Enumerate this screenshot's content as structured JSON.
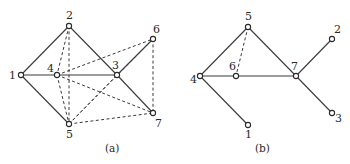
{
  "figures": [
    {
      "id": "a",
      "caption": "(a)",
      "caption_pos": [
        105,
        152
      ],
      "nodes": [
        {
          "id": "1",
          "x": 21,
          "y": 75,
          "lx": 9,
          "ly": 79
        },
        {
          "id": "2",
          "x": 69,
          "y": 26,
          "lx": 66,
          "ly": 19
        },
        {
          "id": "3",
          "x": 117,
          "y": 75,
          "lx": 112,
          "ly": 69
        },
        {
          "id": "4",
          "x": 57,
          "y": 75,
          "lx": 47,
          "ly": 72
        },
        {
          "id": "5",
          "x": 69,
          "y": 124,
          "lx": 66,
          "ly": 138
        },
        {
          "id": "6",
          "x": 153,
          "y": 39,
          "lx": 153,
          "ly": 33
        },
        {
          "id": "7",
          "x": 153,
          "y": 113,
          "lx": 155,
          "ly": 127
        }
      ],
      "solid_edges": [
        [
          "1",
          "2"
        ],
        [
          "1",
          "4"
        ],
        [
          "4",
          "3"
        ],
        [
          "1",
          "5"
        ],
        [
          "2",
          "3"
        ],
        [
          "3",
          "7"
        ],
        [
          "3",
          "6"
        ]
      ],
      "dashed_edges": [
        [
          "2",
          "4"
        ],
        [
          "2",
          "5"
        ],
        [
          "4",
          "5"
        ],
        [
          "4",
          "6"
        ],
        [
          "4",
          "7"
        ],
        [
          "5",
          "3"
        ],
        [
          "5",
          "6"
        ],
        [
          "5",
          "7"
        ],
        [
          "6",
          "7"
        ]
      ]
    },
    {
      "id": "b",
      "caption": "(b)",
      "caption_pos": [
        255,
        152
      ],
      "nodes": [
        {
          "id": "1",
          "x": 248,
          "y": 125,
          "lx": 245,
          "ly": 138
        },
        {
          "id": "2",
          "x": 332,
          "y": 39,
          "lx": 334,
          "ly": 33
        },
        {
          "id": "3",
          "x": 332,
          "y": 113,
          "lx": 335,
          "ly": 122
        },
        {
          "id": "4",
          "x": 200,
          "y": 76,
          "lx": 190,
          "ly": 83
        },
        {
          "id": "5",
          "x": 248,
          "y": 27,
          "lx": 245,
          "ly": 20
        },
        {
          "id": "6",
          "x": 236,
          "y": 76,
          "lx": 229,
          "ly": 70
        },
        {
          "id": "7",
          "x": 296,
          "y": 76,
          "lx": 291,
          "ly": 70
        }
      ],
      "solid_edges": [
        [
          "4",
          "5"
        ],
        [
          "5",
          "7"
        ],
        [
          "4",
          "6"
        ],
        [
          "6",
          "7"
        ],
        [
          "4",
          "1"
        ],
        [
          "7",
          "2"
        ],
        [
          "7",
          "3"
        ]
      ],
      "dashed_edges": [
        [
          "5",
          "6"
        ]
      ]
    }
  ],
  "colors": {
    "stroke": "#3a3a3a",
    "node_fill": "#ffffff",
    "background": "#ffffff"
  }
}
